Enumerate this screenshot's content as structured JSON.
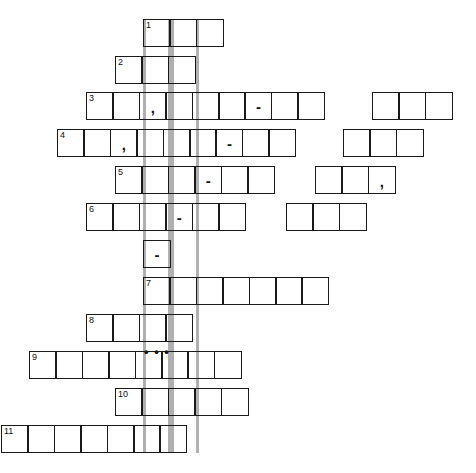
{
  "puzzle": {
    "title": "crossword-grid",
    "cell_size": 28,
    "grid_width": 476,
    "grid_height": 473,
    "highlight_color": "#b0b0b0",
    "border_color": "#1a1a1a",
    "background": "#ffffff",
    "highlight_columns": [
      {
        "name": "highlight-column-left",
        "x": 143,
        "y": 19,
        "width": 28,
        "height": 434
      },
      {
        "name": "highlight-column-right",
        "x": 171,
        "y": 19,
        "width": 28,
        "height": 434
      }
    ],
    "entries": [
      {
        "number": "1",
        "x": 143,
        "y": 19,
        "cells": 3,
        "marks": {}
      },
      {
        "number": "2",
        "x": 115,
        "y": 56,
        "cells": 3,
        "marks": {}
      },
      {
        "number": "3",
        "x": 86,
        "y": 92,
        "cells": 9,
        "marks": {
          "2": ",",
          "6": "-"
        }
      },
      {
        "number": "",
        "x": 372,
        "y": 92,
        "cells": 3,
        "marks": {}
      },
      {
        "number": "4",
        "x": 57,
        "y": 129,
        "cells": 9,
        "marks": {
          "2": ",",
          "6": "-"
        }
      },
      {
        "number": "",
        "x": 343,
        "y": 129,
        "cells": 3,
        "marks": {}
      },
      {
        "number": "5",
        "x": 115,
        "y": 166,
        "cells": 6,
        "marks": {
          "3": "-"
        }
      },
      {
        "number": "",
        "x": 315,
        "y": 166,
        "cells": 3,
        "marks": {
          "2": ","
        }
      },
      {
        "number": "6",
        "x": 86,
        "y": 203,
        "cells": 6,
        "marks": {
          "3": "-"
        }
      },
      {
        "number": "",
        "x": 286,
        "y": 203,
        "cells": 3,
        "marks": {}
      },
      {
        "number": "",
        "x": 143,
        "y": 240,
        "cells": 1,
        "marks": {
          "0": "-"
        }
      },
      {
        "number": "7",
        "x": 143,
        "y": 277,
        "cells": 7,
        "marks": {}
      },
      {
        "number": "8",
        "x": 86,
        "y": 314,
        "cells": 4,
        "marks": {}
      },
      {
        "number": "",
        "x": 143,
        "y": 340,
        "cells": 1,
        "marks": {
          "0": "• • •"
        },
        "borderless": true
      },
      {
        "number": "9",
        "x": 29,
        "y": 351,
        "cells": 8,
        "marks": {}
      },
      {
        "number": "10",
        "x": 115,
        "y": 388,
        "cells": 5,
        "marks": {}
      },
      {
        "number": "11",
        "x": 1,
        "y": 425,
        "cells": 7,
        "marks": {}
      }
    ]
  }
}
